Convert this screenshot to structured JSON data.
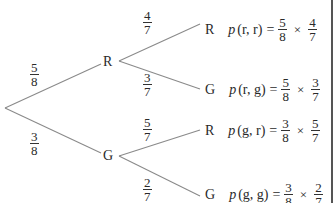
{
  "diagram": {
    "type": "probability-tree",
    "root": {
      "x": 5,
      "y": 108
    },
    "first_level": [
      {
        "label": "R",
        "prob": {
          "num": "5",
          "den": "8"
        }
      },
      {
        "label": "G",
        "prob": {
          "num": "3",
          "den": "8"
        }
      }
    ],
    "second_level": [
      {
        "parent": "R",
        "label": "R",
        "prob": {
          "num": "4",
          "den": "7"
        },
        "outcome": {
          "p": "p",
          "args": "(r, r)",
          "eq": "=",
          "a": {
            "num": "5",
            "den": "8"
          },
          "times": "×",
          "b": {
            "num": "4",
            "den": "7"
          }
        }
      },
      {
        "parent": "R",
        "label": "G",
        "prob": {
          "num": "3",
          "den": "7"
        },
        "outcome": {
          "p": "p",
          "args": "(r, g)",
          "eq": "=",
          "a": {
            "num": "5",
            "den": "8"
          },
          "times": "×",
          "b": {
            "num": "3",
            "den": "7"
          }
        }
      },
      {
        "parent": "G",
        "label": "R",
        "prob": {
          "num": "5",
          "den": "7"
        },
        "outcome": {
          "p": "p",
          "args": "(g, r)",
          "eq": "=",
          "a": {
            "num": "3",
            "den": "8"
          },
          "times": "×",
          "b": {
            "num": "5",
            "den": "7"
          }
        }
      },
      {
        "parent": "G",
        "label": "G",
        "prob": {
          "num": "2",
          "den": "7"
        },
        "outcome": {
          "p": "p",
          "args": "(g, g)",
          "eq": "=",
          "a": {
            "num": "3",
            "den": "8"
          },
          "times": "×",
          "b": {
            "num": "2",
            "den": "7"
          }
        }
      }
    ],
    "colors": {
      "line": "#8a8a8a",
      "text": "#2a2a2a",
      "border": "#555555"
    }
  }
}
